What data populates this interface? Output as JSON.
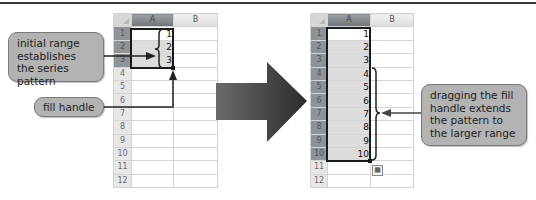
{
  "left_sheet": {
    "columns": [
      "A",
      "B"
    ],
    "rows": [
      {
        "n": "1",
        "a": "1"
      },
      {
        "n": "2",
        "a": "2"
      },
      {
        "n": "3",
        "a": "3"
      },
      {
        "n": "4",
        "a": ""
      },
      {
        "n": "5",
        "a": ""
      },
      {
        "n": "6",
        "a": ""
      },
      {
        "n": "7",
        "a": ""
      },
      {
        "n": "8",
        "a": ""
      },
      {
        "n": "9",
        "a": ""
      },
      {
        "n": "10",
        "a": ""
      },
      {
        "n": "11",
        "a": ""
      },
      {
        "n": "12",
        "a": ""
      }
    ]
  },
  "right_sheet": {
    "columns": [
      "A",
      "B"
    ],
    "rows": [
      {
        "n": "1",
        "a": "1"
      },
      {
        "n": "2",
        "a": "2"
      },
      {
        "n": "3",
        "a": "3"
      },
      {
        "n": "4",
        "a": "4"
      },
      {
        "n": "5",
        "a": "5"
      },
      {
        "n": "6",
        "a": "6"
      },
      {
        "n": "7",
        "a": "7"
      },
      {
        "n": "8",
        "a": "8"
      },
      {
        "n": "9",
        "a": "9"
      },
      {
        "n": "10",
        "a": "10"
      },
      {
        "n": "11",
        "a": ""
      },
      {
        "n": "12",
        "a": ""
      }
    ]
  },
  "callouts": {
    "initial_range": "initial range establishes the series pattern",
    "fill_handle": "fill handle",
    "dragging": "dragging the fill handle extends the pattern to the larger range"
  },
  "icons": {
    "auto_fill_options": "auto-fill-options-icon",
    "big_arrow": "right-arrow-icon"
  },
  "colors": {
    "callout_bg": "#b3b3b3",
    "selected_header": "#8d9397",
    "arrow": "#3a3a3a"
  }
}
